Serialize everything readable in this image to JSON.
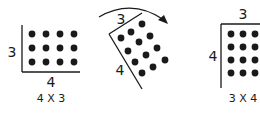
{
  "panels": [
    {
      "id": "panel-4x3",
      "side_label": "3",
      "bottom_label": "4",
      "caption": "4 X 3",
      "rows": 3,
      "cols": 4
    },
    {
      "id": "panel-rotating",
      "top_label": "3",
      "side_label": "4",
      "rows": 3,
      "cols": 4,
      "arrow": "rotation-arrow"
    },
    {
      "id": "panel-3x4",
      "top_label": "3",
      "side_label": "4",
      "caption": "3 X 4",
      "rows": 4,
      "cols": 3
    }
  ],
  "colors": {
    "ink": "#1a1a1a",
    "background": "#ffffff"
  }
}
